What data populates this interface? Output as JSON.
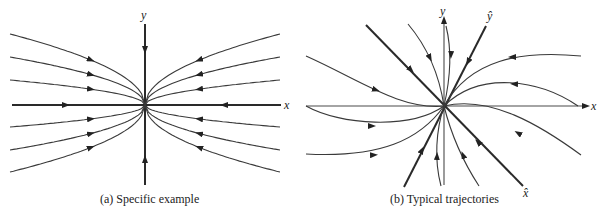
{
  "panels": [
    {
      "id": "a",
      "caption": "(a) Specific example",
      "axis_labels": {
        "x": "x",
        "y": "y"
      },
      "description": "Phase portrait: all trajectories approach origin tangent to y-axis; x-axis and y-axis are straight-line trajectories"
    },
    {
      "id": "b",
      "caption": "(b) Typical trajectories",
      "axis_labels": {
        "x": "x",
        "y": "y",
        "x_hat": "x̂",
        "y_hat": "ŷ"
      },
      "description": "Phase portrait in rotated eigen-coordinates x̂, ŷ; trajectories approach origin tangent to ŷ direction"
    }
  ],
  "colors": {
    "stroke": "#3a3a3a",
    "background": "#ffffff"
  }
}
